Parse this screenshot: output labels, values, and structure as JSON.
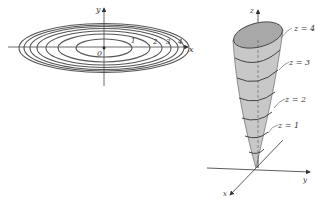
{
  "contour_plot": {
    "x_axis_label": "x",
    "y_axis_label": "y",
    "origin_label": "0",
    "level_labels": [
      "1",
      "2",
      "3",
      "4"
    ],
    "num_contours": 7,
    "colors": {
      "curve": "#555555",
      "axis": "#333333"
    }
  },
  "surface_plot": {
    "x_axis_label": "x",
    "y_axis_label": "y",
    "z_axis_label": "z",
    "level_labels": [
      "z = 4",
      "z = 3",
      "z = 2",
      "z = 1"
    ],
    "colors": {
      "surface": "#c8c8c8",
      "surface_inner": "#a8a8a8",
      "curve": "#444444",
      "axis": "#333333"
    }
  }
}
